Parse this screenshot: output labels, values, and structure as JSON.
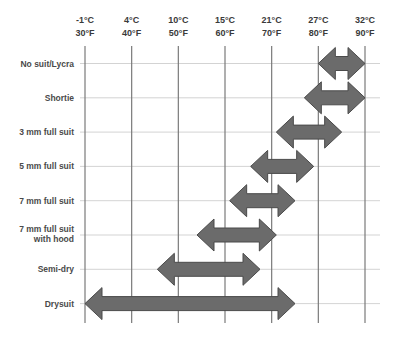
{
  "chart_data": {
    "type": "range-bar",
    "title": "",
    "xlabel": "Water temperature",
    "ylabel": "Suit type",
    "x_ticks": [
      {
        "c": "-1°C",
        "f": "30°F",
        "value_f": 30
      },
      {
        "c": "4°C",
        "f": "40°F",
        "value_f": 40
      },
      {
        "c": "10°C",
        "f": "50°F",
        "value_f": 50
      },
      {
        "c": "15°C",
        "f": "60°F",
        "value_f": 60
      },
      {
        "c": "21°C",
        "f": "70°F",
        "value_f": 70
      },
      {
        "c": "27°C",
        "f": "80°F",
        "value_f": 80
      },
      {
        "c": "32°C",
        "f": "90°F",
        "value_f": 90
      }
    ],
    "xlim_f": [
      30,
      90
    ],
    "grid": true,
    "legend": "none",
    "series": [
      {
        "name": "No suit/Lycra",
        "lines": [
          "No suit/Lycra"
        ],
        "min_f": 80,
        "max_f": 90
      },
      {
        "name": "Shortie",
        "lines": [
          "Shortie"
        ],
        "min_f": 77,
        "max_f": 90
      },
      {
        "name": "3 mm full suit",
        "lines": [
          "3 mm full suit"
        ],
        "min_f": 71,
        "max_f": 85
      },
      {
        "name": "5 mm full suit",
        "lines": [
          "5 mm full suit"
        ],
        "min_f": 65.5,
        "max_f": 79
      },
      {
        "name": "7 mm full suit",
        "lines": [
          "7 mm full suit"
        ],
        "min_f": 61,
        "max_f": 75
      },
      {
        "name": "7 mm full suit with hood",
        "lines": [
          "7 mm full suit",
          "with hood"
        ],
        "min_f": 54,
        "max_f": 71
      },
      {
        "name": "Semi-dry",
        "lines": [
          "Semi-dry"
        ],
        "min_f": 45.5,
        "max_f": 67.5
      },
      {
        "name": "Drysuit",
        "lines": [
          "Drysuit"
        ],
        "min_f": 30,
        "max_f": 75
      }
    ],
    "colors": {
      "arrow_fill": "#6b6b6b",
      "arrow_stroke": "#4a4a4a",
      "vertical_grid": "#7a7a7a",
      "horizontal_grid": "#c8c8c8",
      "text": "#3a3a3a"
    }
  }
}
